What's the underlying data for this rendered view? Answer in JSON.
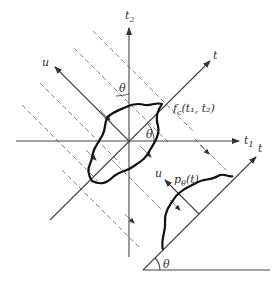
{
  "figure": {
    "type": "projection-diagram",
    "labels": {
      "t2_axis": "t",
      "t2_sub": "2",
      "t1_axis": "t",
      "t1_sub": "1",
      "t_axis": "t",
      "u_axis": "u",
      "theta_top": "θ",
      "theta_center": "θ",
      "function_label": "f",
      "function_sub": "c",
      "function_args": "(t₁, t₂)",
      "lower_t_axis": "t",
      "lower_u_axis": "u",
      "projection_label": "p",
      "projection_sub": "θ",
      "projection_args": "(t)",
      "theta_bottom": "θ"
    },
    "colors": {
      "line": "#444444",
      "curve": "#111111",
      "dashed": "#777777"
    }
  }
}
